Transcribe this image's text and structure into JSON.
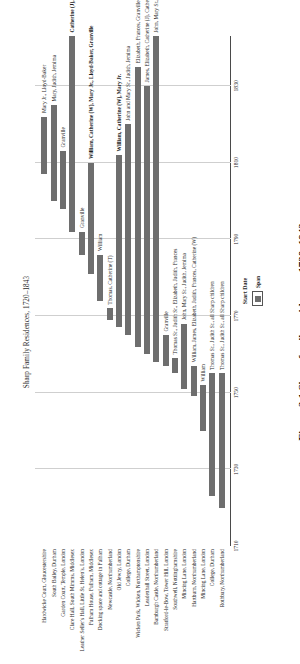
{
  "figure": {
    "caption": "Figure 3.1  Sharp family residences, 1720–1843",
    "chart_title": "Sharp Family Residences, 1720–1843"
  },
  "axis": {
    "title": "Start Date",
    "ticks": [
      1710,
      1730,
      1750,
      1770,
      1790,
      1810,
      1830
    ],
    "tick_labels": [
      "1710",
      "1730",
      "1750",
      "1770",
      "1790",
      "1810",
      "1830"
    ],
    "min": 1710,
    "max": 1843
  },
  "legend": {
    "label": "Span",
    "color": "#6e6e6e"
  },
  "chart_data": {
    "type": "bar",
    "title": "Sharp Family Residences, 1720–1843",
    "xlabel": "Start Date",
    "ylabel": "",
    "xlim": [
      1710,
      1843
    ],
    "grid": true,
    "legend_position": "bottom",
    "categories": [
      "Rothbury, Northumberland",
      "College, Durham",
      "Mincing Lane, London",
      "Hartburn, Northumberland",
      "Mincing Lane, London",
      "Southwell, Nottinghamshire",
      "Stratford-le-Bow, Tower Hill, London",
      "Bamburgh Castle, Northumberland",
      "Leadenhall Street, London",
      "Wicken Park, Wicken, Northamptonshire",
      "College, Durham",
      "Old Jewry, London",
      "Newcastle, Northumberland",
      "Docking space and cottage in Fulham",
      "Fulham House, Fulham, Middlesex",
      "Leather Seller's Hall, Little St. Helen's, London",
      "Clare Hall, South Mimms, Middlesex",
      "Garden Court, Temple, London",
      "South Bailey, Durham",
      "Hardwicke Court, Gloucestershire"
    ],
    "bars": [
      {
        "category": "Rothbury, Northumberland",
        "start": 1720,
        "end": 1755,
        "label": "Thomas Sr., Judith Sr., all Sharp children"
      },
      {
        "category": "College, Durham",
        "start": 1723,
        "end": 1755,
        "label": "Thomas Sr., Judith Sr., all Sharp children"
      },
      {
        "category": "Mincing Lane, London",
        "start": 1740,
        "end": 1752,
        "label": "William"
      },
      {
        "category": "Hartburn, Northumberland",
        "start": 1749,
        "end": 1757,
        "label": "William, James, Elizabeth, Judith, Frances, Catherine (W)"
      },
      {
        "category": "Mincing Lane, London",
        "start": 1751,
        "end": 1768,
        "label": "John, Mary Sr., Judith, Jemima"
      },
      {
        "category": "Southwell, Nottinghamshire",
        "start": 1755,
        "end": 1759,
        "label": "Thomas Sr., Judith Sr., Elizabeth, Judith, Frances"
      },
      {
        "category": "Stratford-le-Bow, Tower Hill, London",
        "start": 1757,
        "end": 1765,
        "label": "Granville"
      },
      {
        "category": "Bamburgh Castle, Northumberland",
        "start": 1758,
        "end": 1843,
        "label": "John, Mary Sr., Thomas"
      },
      {
        "category": "Leadenhall Street, London",
        "start": 1760,
        "end": 1830,
        "label": "James, Elizabeth, Catherine (J), Catherine Jr., Granville"
      },
      {
        "category": "Wicken Park, Wicken, Northamptonshire",
        "start": 1762,
        "end": 1835,
        "label": "Elizabeth, Frances, Granville, Catherine Jr."
      },
      {
        "category": "College, Durham",
        "start": 1765,
        "end": 1820,
        "label": "John and Mary Sr., Judith, Jemima"
      },
      {
        "category": "Old Jewry, London",
        "start": 1767,
        "end": 1812,
        "label": "William, Catherine (W), Mary Jr."
      },
      {
        "category": "Newcastle, Northumberland",
        "start": 1769,
        "end": 1772,
        "label": "Thomas, Catherine (T)"
      },
      {
        "category": "Docking space and cottage in Fulham",
        "start": 1774,
        "end": 1786,
        "label": "William"
      },
      {
        "category": "Fulham House, Fulham, Middlesex",
        "start": 1781,
        "end": 1810,
        "label": "William, Catherine (W), Mary Jr., Lloyd-Baker, Granville"
      },
      {
        "category": "Leather Seller's Hall, Little St. Helen's, London",
        "start": 1786,
        "end": 1792,
        "label": "Granville"
      },
      {
        "category": "Clare Hall, South Mimms, Middlesex",
        "start": 1792,
        "end": 1843,
        "label": "Catherine (J), Catherine Jr., Andrew"
      },
      {
        "category": "Garden Court, Temple, London",
        "start": 1798,
        "end": 1813,
        "label": "Granville"
      },
      {
        "category": "South Bailey, Durham",
        "start": 1800,
        "end": 1825,
        "label": "Mary, Judith, Jemima"
      },
      {
        "category": "Hardwicke Court, Gloucestershire",
        "start": 1807,
        "end": 1822,
        "label": "Mary Jr., Lloyd-Baker"
      }
    ]
  }
}
